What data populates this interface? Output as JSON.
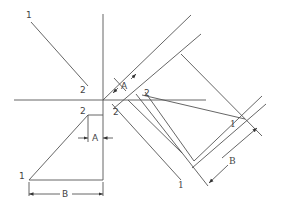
{
  "diagram": {
    "title": "",
    "labels": {
      "top_left_1": "1",
      "top_left_2": "2",
      "triangle_2": "2",
      "triangle_1": "1",
      "triangle_A": "A",
      "triangle_B": "B",
      "center_2": "2",
      "rotated_A": "A",
      "rotated_2": "2",
      "rotated_1_right": "1",
      "rotated_1_bottom": "1",
      "rotated_B": "B"
    },
    "line_color": "#555555",
    "background": "#ffffff"
  }
}
